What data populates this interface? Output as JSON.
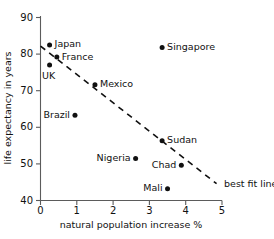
{
  "chart_data": {
    "type": "scatter",
    "title": "",
    "xlabel": "natural population increase %",
    "ylabel": "life expectancy in years",
    "xlim": [
      0,
      5
    ],
    "ylim": [
      40,
      90
    ],
    "xticks": [
      "0",
      "1",
      "2",
      "3",
      "4",
      "5"
    ],
    "yticks": [
      "40",
      "50",
      "60",
      "70",
      "80",
      "90"
    ],
    "grid": false,
    "legend": "none",
    "points": [
      {
        "label": "Japan",
        "x": 0.25,
        "y": 82.5,
        "label_side": "right"
      },
      {
        "label": "France",
        "x": 0.45,
        "y": 79.2,
        "label_side": "right"
      },
      {
        "label": "UK",
        "x": 0.25,
        "y": 77.0,
        "label_side": "below"
      },
      {
        "label": "Mexico",
        "x": 1.5,
        "y": 71.6,
        "label_side": "right"
      },
      {
        "label": "Brazil",
        "x": 0.95,
        "y": 63.3,
        "label_side": "left"
      },
      {
        "label": "Singapore",
        "x": 3.35,
        "y": 81.8,
        "label_side": "right"
      },
      {
        "label": "Sudan",
        "x": 3.35,
        "y": 56.3,
        "label_side": "right"
      },
      {
        "label": "Nigeria",
        "x": 2.62,
        "y": 51.5,
        "label_side": "left"
      },
      {
        "label": "Chad",
        "x": 3.88,
        "y": 49.6,
        "label_side": "left"
      },
      {
        "label": "Mali",
        "x": 3.5,
        "y": 43.2,
        "label_side": "left"
      }
    ],
    "best_fit_line": {
      "label": "best fit line",
      "x_start": 0.0,
      "y_start": 82.2,
      "x_end": 4.85,
      "y_end": 44.6
    }
  }
}
